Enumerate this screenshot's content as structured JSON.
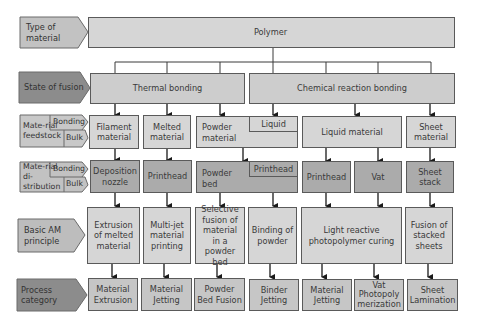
{
  "colors": {
    "label_light": "#c2c2c2",
    "label_dark": "#8c8c8c",
    "box_light": "#d6d6d6",
    "box_dark": "#ababab",
    "line": "#3a3a3a"
  },
  "row_labels": {
    "type_of_material": "Type of material",
    "state_of_fusion": "State of fusion",
    "material_feedstock": "Mate-rial feedstock",
    "material_distribution": "Mate-rial di-stribution",
    "bonding": "Bonding",
    "bulk": "Bulk",
    "basic_am_principle": "Basic AM principle",
    "process_category": "Process category"
  },
  "type_of_material": "Polymer",
  "state_of_fusion": [
    "Thermal bonding",
    "Chemical reaction bonding"
  ],
  "feedstock": {
    "filament": "Filament material",
    "melted": "Melted material",
    "powder": "Powder material",
    "powder_liquid": "Liquid",
    "liquid": "Liquid material",
    "sheet": "Sheet material"
  },
  "distribution": {
    "nozzle": "Deposition nozzle",
    "printhead1": "Printhead",
    "powder_bed": "Powder bed",
    "powder_bed_printhead": "Printhead",
    "printhead2": "Printhead",
    "vat": "Vat",
    "sheet_stack": "Sheet stack"
  },
  "principle": {
    "extrusion": "Extrusion of melted material",
    "multijet": "Multi-jet material printing",
    "selective": "Selective fusion of material in a powder bed",
    "binding": "Binding of powder",
    "light": "Light reactive photopolymer curing",
    "fusion": "Fusion of stacked sheets"
  },
  "category": {
    "mat_extrusion": "Material Extrusion",
    "mat_jetting1": "Material Jetting",
    "powder_bed_fusion": "Powder Bed Fusion",
    "binder_jetting": "Binder Jetting",
    "mat_jetting2": "Material Jetting",
    "vat_photo": "Vat Photopoly merization",
    "sheet_lamination": "Sheet Lamination"
  }
}
